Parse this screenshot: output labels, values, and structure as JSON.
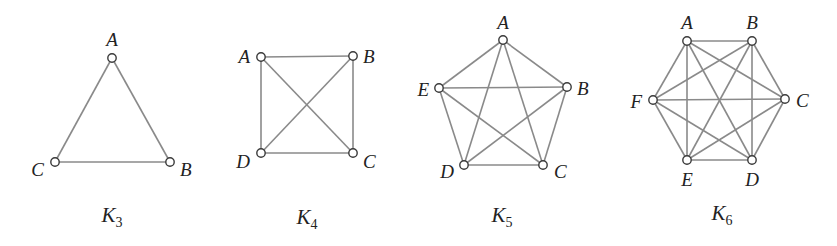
{
  "figure": {
    "colors": {
      "edge": "#8a8a8a",
      "node_stroke": "#3a3a3a",
      "node_fill": "#ffffff",
      "text": "#222222"
    },
    "graphs": [
      {
        "id": "K3",
        "caption_main": "K",
        "caption_sub": "3",
        "caption_pos": [
          112,
          222
        ],
        "nodes": [
          {
            "name": "A",
            "x": 112,
            "y": 58,
            "lx": 112,
            "ly": 46,
            "anchor": "middle"
          },
          {
            "name": "B",
            "x": 170,
            "y": 162,
            "lx": 180,
            "ly": 176,
            "anchor": "start"
          },
          {
            "name": "C",
            "x": 55,
            "y": 162,
            "lx": 44,
            "ly": 176,
            "anchor": "end"
          }
        ],
        "edges": [
          [
            "A",
            "B"
          ],
          [
            "A",
            "C"
          ],
          [
            "B",
            "C"
          ]
        ]
      },
      {
        "id": "K4",
        "caption_main": "K",
        "caption_sub": "4",
        "caption_pos": [
          307,
          224
        ],
        "nodes": [
          {
            "name": "A",
            "x": 261,
            "y": 57,
            "lx": 250,
            "ly": 63,
            "anchor": "end"
          },
          {
            "name": "B",
            "x": 353,
            "y": 56,
            "lx": 363,
            "ly": 63,
            "anchor": "start"
          },
          {
            "name": "C",
            "x": 353,
            "y": 153,
            "lx": 363,
            "ly": 168,
            "anchor": "start"
          },
          {
            "name": "D",
            "x": 261,
            "y": 153,
            "lx": 250,
            "ly": 168,
            "anchor": "end"
          }
        ],
        "edges": [
          [
            "A",
            "B"
          ],
          [
            "A",
            "C"
          ],
          [
            "A",
            "D"
          ],
          [
            "B",
            "C"
          ],
          [
            "B",
            "D"
          ],
          [
            "C",
            "D"
          ]
        ]
      },
      {
        "id": "K5",
        "caption_main": "K",
        "caption_sub": "5",
        "caption_pos": [
          502,
          222
        ],
        "nodes": [
          {
            "name": "A",
            "x": 503,
            "y": 40,
            "lx": 503,
            "ly": 29,
            "anchor": "middle"
          },
          {
            "name": "B",
            "x": 567,
            "y": 87,
            "lx": 577,
            "ly": 95,
            "anchor": "start"
          },
          {
            "name": "C",
            "x": 543,
            "y": 165,
            "lx": 554,
            "ly": 178,
            "anchor": "start"
          },
          {
            "name": "D",
            "x": 464,
            "y": 165,
            "lx": 454,
            "ly": 178,
            "anchor": "end"
          },
          {
            "name": "E",
            "x": 439,
            "y": 88,
            "lx": 429,
            "ly": 96,
            "anchor": "end"
          }
        ],
        "edges": [
          [
            "A",
            "B"
          ],
          [
            "A",
            "C"
          ],
          [
            "A",
            "D"
          ],
          [
            "A",
            "E"
          ],
          [
            "B",
            "C"
          ],
          [
            "B",
            "D"
          ],
          [
            "B",
            "E"
          ],
          [
            "C",
            "D"
          ],
          [
            "C",
            "E"
          ],
          [
            "D",
            "E"
          ]
        ]
      },
      {
        "id": "K6",
        "caption_main": "K",
        "caption_sub": "6",
        "caption_pos": [
          722,
          220
        ],
        "nodes": [
          {
            "name": "A",
            "x": 687,
            "y": 41,
            "lx": 687,
            "ly": 29,
            "anchor": "middle"
          },
          {
            "name": "B",
            "x": 752,
            "y": 41,
            "lx": 752,
            "ly": 29,
            "anchor": "middle"
          },
          {
            "name": "C",
            "x": 785,
            "y": 99,
            "lx": 796,
            "ly": 107,
            "anchor": "start"
          },
          {
            "name": "D",
            "x": 752,
            "y": 160,
            "lx": 752,
            "ly": 186,
            "anchor": "middle"
          },
          {
            "name": "E",
            "x": 687,
            "y": 160,
            "lx": 687,
            "ly": 186,
            "anchor": "middle"
          },
          {
            "name": "F",
            "x": 653,
            "y": 100,
            "lx": 642,
            "ly": 108,
            "anchor": "end"
          }
        ],
        "edges": [
          [
            "A",
            "B"
          ],
          [
            "A",
            "C"
          ],
          [
            "A",
            "D"
          ],
          [
            "A",
            "E"
          ],
          [
            "A",
            "F"
          ],
          [
            "B",
            "C"
          ],
          [
            "B",
            "D"
          ],
          [
            "B",
            "E"
          ],
          [
            "B",
            "F"
          ],
          [
            "C",
            "D"
          ],
          [
            "C",
            "E"
          ],
          [
            "C",
            "F"
          ],
          [
            "D",
            "E"
          ],
          [
            "D",
            "F"
          ],
          [
            "E",
            "F"
          ]
        ]
      }
    ]
  }
}
